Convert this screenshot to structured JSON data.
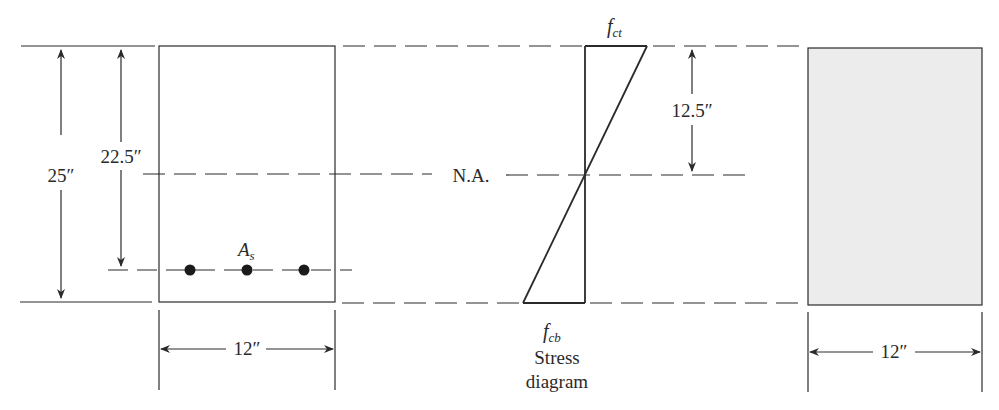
{
  "diagram": {
    "section": {
      "depth_label": "25″",
      "effective_depth_label": "22.5″",
      "width_label": "12″",
      "steel_label": "A",
      "steel_subscript": "s",
      "bar_count": 3
    },
    "stress_diagram": {
      "top_stress_label": "f",
      "top_stress_subscript": "ct",
      "bottom_stress_label": "f",
      "bottom_stress_subscript": "cb",
      "neutral_axis_label": "N.A.",
      "na_distance_label": "12.5″",
      "caption_line1": "Stress",
      "caption_line2": "diagram"
    },
    "transformed_section": {
      "width_label": "12″",
      "fill_color": "#ececec"
    },
    "colors": {
      "line": "#2a2a2a",
      "shade": "#ececec",
      "background": "#ffffff"
    }
  }
}
